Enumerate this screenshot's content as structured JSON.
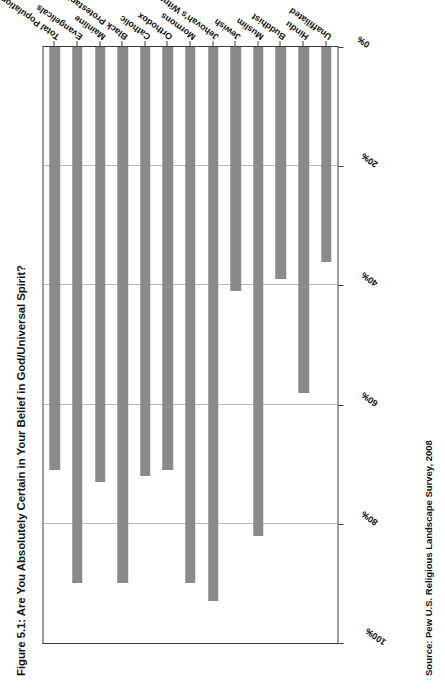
{
  "chart_data": {
    "type": "bar",
    "orientation": "horizontal",
    "title": "Figure 5.1: Are You Absolutely Certain in Your Belief in God/Universal Spirit?",
    "source": "Source: Pew U.S. Religious Landscape Survey, 2008",
    "xlabel": "",
    "ylabel": "",
    "xlim": [
      100,
      0
    ],
    "x_axis_reversed": true,
    "grid": true,
    "legend": false,
    "bar_color": "#8a8a8a",
    "tick_labels": [
      "100%",
      "80%",
      "60%",
      "40%",
      "20%",
      "0%"
    ],
    "tick_values": [
      100,
      80,
      60,
      40,
      20,
      0
    ],
    "categories": [
      "Total Population",
      "Evangelicals",
      "Mainline",
      "Black Protestants",
      "Catholic",
      "Orthodox",
      "Mormons",
      "Jehovah's Witnesses",
      "Jewish",
      "Muslim",
      "Buddhist",
      "Hindu",
      "Unaffiliated"
    ],
    "values": [
      71,
      90,
      73,
      90,
      72,
      71,
      90,
      93,
      41,
      82,
      39,
      58,
      36
    ]
  }
}
